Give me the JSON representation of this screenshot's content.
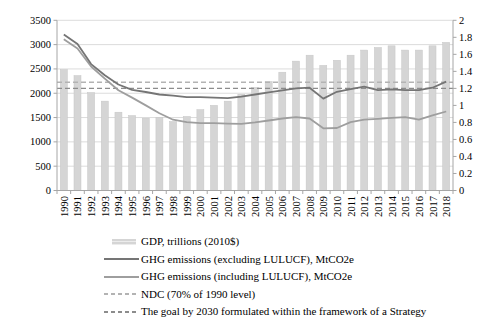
{
  "chart_data": {
    "type": "combo-bar-line",
    "title": "",
    "categories": [
      "1990",
      "1991",
      "1992",
      "1993",
      "1994",
      "1995",
      "1996",
      "1997",
      "1998",
      "1999",
      "2000",
      "2001",
      "2002",
      "2003",
      "2004",
      "2005",
      "2006",
      "2007",
      "2008",
      "2009",
      "2010",
      "2011",
      "2012",
      "2013",
      "2014",
      "2015",
      "2016",
      "2017",
      "2018"
    ],
    "left_axis": {
      "min": 0,
      "max": 3500,
      "step": 500,
      "labels": [
        "0",
        "500",
        "1000",
        "1500",
        "2000",
        "2500",
        "3000",
        "3500"
      ]
    },
    "right_axis": {
      "min": 0,
      "max": 2,
      "step": 0.2,
      "labels": [
        "0",
        "0.2",
        "0.4",
        "0.6",
        "0.8",
        "1",
        "1.2",
        "1.4",
        "1.6",
        "1.8",
        "2"
      ]
    },
    "grid": true,
    "legend_position": "bottom-left",
    "colors": {
      "grid": "#dcdcdc",
      "axis": "#a6a6a6",
      "text": "#000000"
    },
    "series": [
      {
        "name": "GDP, trillions (2010$)",
        "type": "bar",
        "axis": "right",
        "color": "#d5d5d5",
        "edge": "#c6c6c6",
        "values": [
          1.42,
          1.35,
          1.15,
          1.05,
          0.92,
          0.88,
          0.85,
          0.86,
          0.81,
          0.87,
          0.95,
          1.0,
          1.05,
          1.13,
          1.21,
          1.28,
          1.39,
          1.52,
          1.59,
          1.47,
          1.53,
          1.59,
          1.65,
          1.68,
          1.7,
          1.65,
          1.65,
          1.7,
          1.74
        ]
      },
      {
        "name": "GHG emissions (excluding LULUCF), MtCO2e",
        "type": "line",
        "axis": "left",
        "color": "#757575",
        "values": [
          3210,
          3010,
          2600,
          2370,
          2180,
          2070,
          2025,
          1975,
          1950,
          1920,
          1920,
          1910,
          1900,
          1930,
          1975,
          2020,
          2060,
          2100,
          2115,
          1890,
          2030,
          2085,
          2135,
          2065,
          2080,
          2065,
          2065,
          2115,
          2240
        ]
      },
      {
        "name": "GHG emissions (including LULUCF), MtCO2e",
        "type": "line",
        "axis": "left",
        "color": "#9e9e9e",
        "values": [
          3110,
          2920,
          2550,
          2300,
          2060,
          1910,
          1750,
          1590,
          1455,
          1405,
          1385,
          1385,
          1375,
          1370,
          1400,
          1440,
          1480,
          1510,
          1480,
          1280,
          1285,
          1405,
          1455,
          1475,
          1495,
          1510,
          1455,
          1545,
          1625
        ]
      },
      {
        "name": "NDC (70% of 1990 level)",
        "type": "dashed-reference",
        "axis": "left",
        "color": "#b3b3b3",
        "value": 2225
      },
      {
        "name": "The goal by 2030 formulated within the framework of a Strategy",
        "type": "dashed-reference",
        "axis": "left",
        "color": "#8c8c8c",
        "value": 2100
      }
    ]
  }
}
